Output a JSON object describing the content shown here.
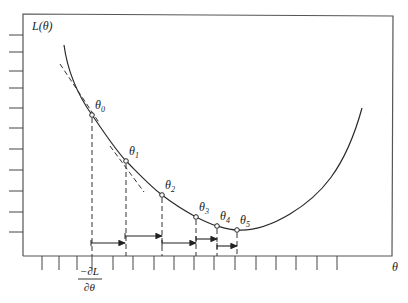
{
  "diagram": {
    "y_axis_label": "L(θ)",
    "x_axis_label": "θ",
    "gradient_label": {
      "numerator": "−∂L",
      "denominator": "∂θ"
    },
    "points": [
      {
        "label": "θ",
        "sub": "0",
        "x": 92,
        "y": 115
      },
      {
        "label": "θ",
        "sub": "1",
        "x": 126,
        "y": 161
      },
      {
        "label": "θ",
        "sub": "2",
        "x": 162,
        "y": 195
      },
      {
        "label": "θ",
        "sub": "3",
        "x": 196,
        "y": 217
      },
      {
        "label": "θ",
        "sub": "4",
        "x": 217,
        "y": 226
      },
      {
        "label": "θ",
        "sub": "5",
        "x": 237,
        "y": 230
      }
    ],
    "step_arrows": [
      {
        "x1": 91,
        "x2": 125,
        "y": 243
      },
      {
        "x1": 125,
        "x2": 162,
        "y": 236
      },
      {
        "x1": 162,
        "x2": 196,
        "y": 243
      },
      {
        "x1": 196,
        "x2": 217,
        "y": 239
      },
      {
        "x1": 217,
        "x2": 237,
        "y": 246
      }
    ],
    "left_ticks_y": [
      35,
      52,
      71,
      88,
      108,
      128,
      149,
      170,
      191,
      212,
      232
    ],
    "bottom_ticks_x": [
      42,
      59,
      77,
      92,
      113,
      133,
      154,
      174,
      194,
      214,
      235,
      256,
      276,
      296,
      317,
      337
    ],
    "colors": {
      "line": "#2a2a2a",
      "frame": "#555555"
    }
  }
}
